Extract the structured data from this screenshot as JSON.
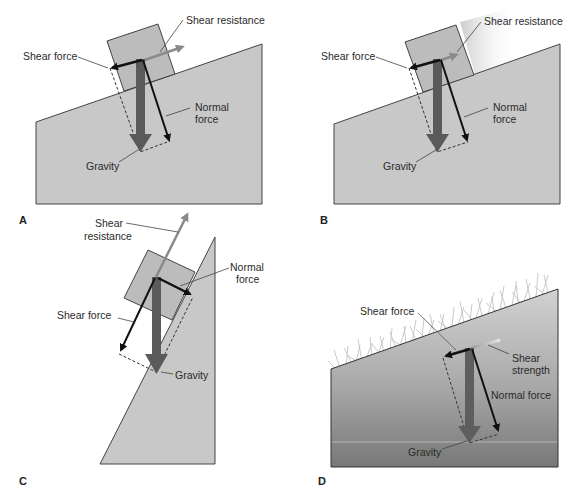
{
  "figure": {
    "panels": [
      {
        "letter": "A",
        "labels": {
          "shear_resistance": "Shear resistance",
          "shear_force": "Shear force",
          "normal_force_1": "Normal",
          "normal_force_2": "force",
          "gravity": "Gravity"
        }
      },
      {
        "letter": "B",
        "labels": {
          "shear_resistance": "Shear resistance",
          "shear_force": "Shear force",
          "normal_force_1": "Normal",
          "normal_force_2": "force",
          "gravity": "Gravity"
        }
      },
      {
        "letter": "C",
        "labels": {
          "shear_resistance_1": "Shear",
          "shear_resistance_2": "resistance",
          "shear_force": "Shear force",
          "normal_force_1": "Normal",
          "normal_force_2": "force",
          "gravity": "Gravity"
        }
      },
      {
        "letter": "D",
        "labels": {
          "shear_force": "Shear force",
          "shear_strength_1": "Shear",
          "shear_strength_2": "strength",
          "normal_force": "Normal force",
          "gravity": "Gravity"
        }
      }
    ],
    "colors": {
      "slope_fill": "#c8c8c8",
      "block_fill": "#bdbdbd",
      "gravity_arrow": "#5a5a5a",
      "shear_force_arrow": "#111111",
      "normal_force_arrow": "#111111",
      "shear_resistance_arrow": "#8a8a8a",
      "outline": "#3a3a3a",
      "soil_gradient_top": "#cfcfcf",
      "soil_gradient_bottom": "#7a7a7a",
      "vegetation": "#bdbdbd"
    }
  }
}
